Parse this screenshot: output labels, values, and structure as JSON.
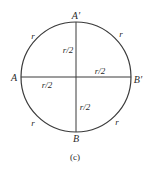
{
  "diagram": {
    "caption": "(c)",
    "colors": {
      "stroke": "#3a3a3a",
      "text": "#2a2a2a",
      "background": "#ffffff"
    },
    "circle": {
      "cx": 76,
      "cy": 77,
      "r": 55
    },
    "points": {
      "A": "A",
      "A_prime": "A′",
      "B": "B",
      "B_prime": "B′"
    },
    "arc_labels": {
      "top_left": "r",
      "top_right": "r",
      "bottom_left": "r",
      "bottom_right": "r"
    },
    "segment_labels": {
      "upper_vertical": "r/2",
      "right_horizontal": "r/2",
      "left_horizontal": "r/2",
      "lower_vertical": "r/2"
    }
  }
}
